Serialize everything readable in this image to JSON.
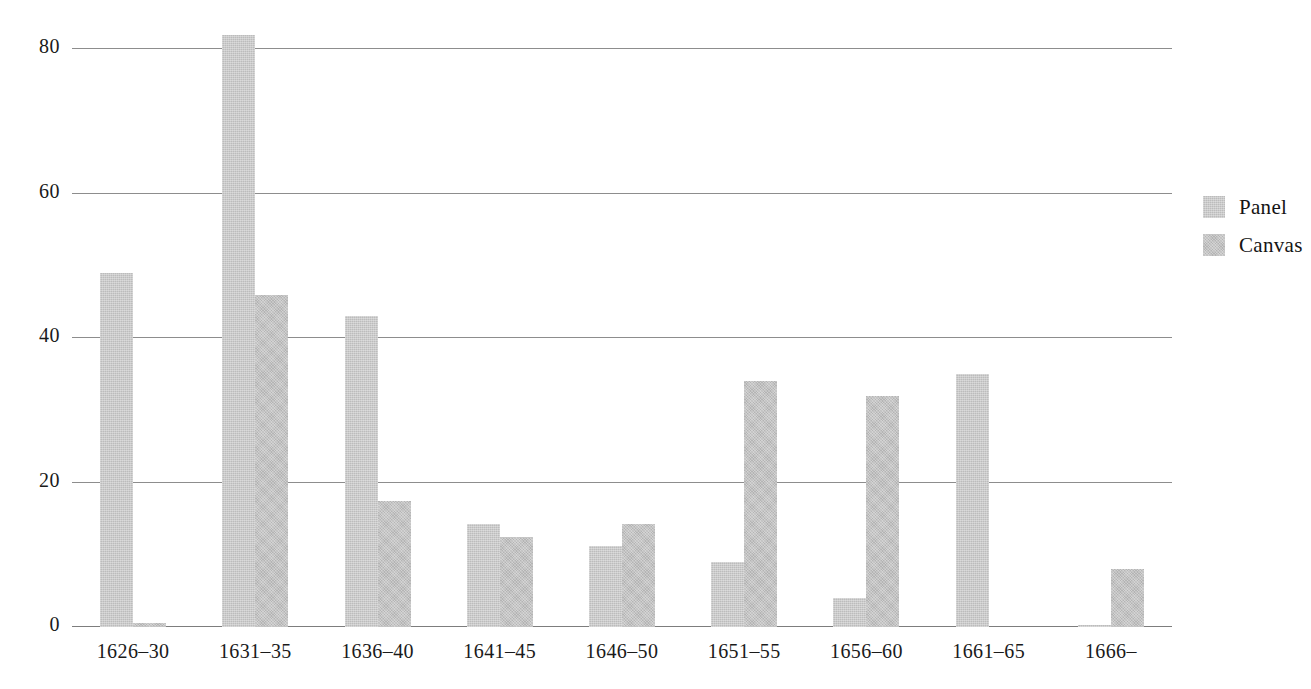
{
  "chart_data": {
    "type": "bar",
    "title": "",
    "subtitle": "",
    "xlabel": "",
    "ylabel": "",
    "categories": [
      "1626–30",
      "1631–35",
      "1636–40",
      "1641–45",
      "1646–50",
      "1651–55",
      "1656–60",
      "1661–65",
      "1666–"
    ],
    "series": [
      {
        "name": "Panel",
        "values": [
          49,
          82,
          43,
          14.3,
          11.2,
          9,
          4,
          35,
          0.3
        ]
      },
      {
        "name": "Canvas",
        "values": [
          0.6,
          46,
          17.5,
          12.5,
          14.3,
          34,
          32,
          0,
          8
        ]
      }
    ],
    "ylim": [
      0,
      82
    ],
    "yticks": [
      0,
      20,
      40,
      60,
      80
    ],
    "ytick_labels": [
      "0",
      "20",
      "40",
      "60",
      "80"
    ],
    "grid": true,
    "grid_axis": "y",
    "legend_position": "right",
    "bar_grouping": "grouped",
    "colors": {
      "panel": "#bcbcbc",
      "canvas": "#b4b4b4",
      "gridline": "#8d8d8d",
      "axis": "#7d7d7d",
      "text": "#1a1a1a",
      "background": "#ffffff"
    }
  },
  "legend": {
    "items": [
      {
        "label": "Panel"
      },
      {
        "label": "Canvas"
      }
    ]
  }
}
